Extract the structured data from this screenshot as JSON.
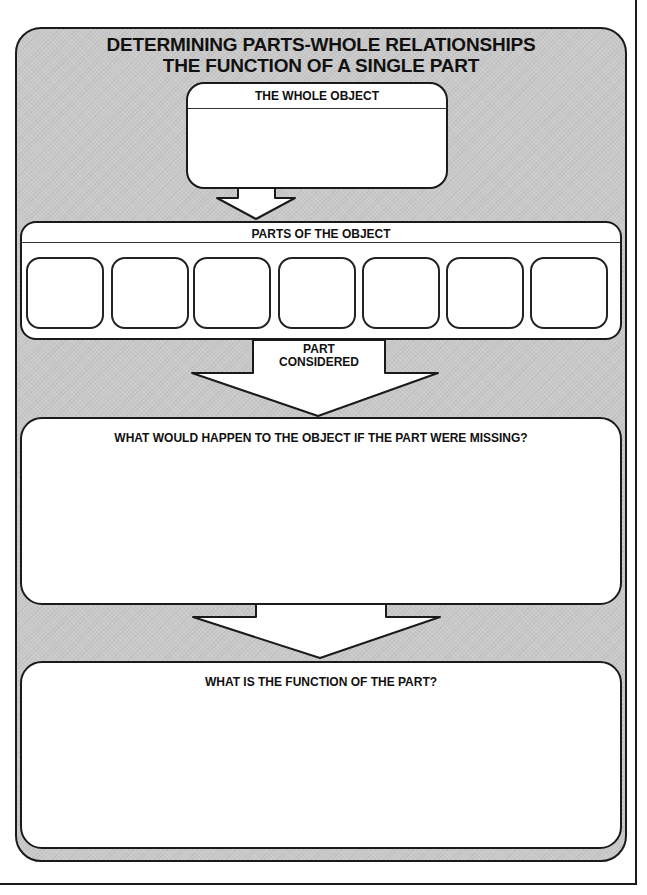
{
  "title": {
    "line1": "DETERMINING PARTS-WHOLE RELATIONSHIPS",
    "line2": "THE FUNCTION OF A SINGLE PART"
  },
  "whole_object": {
    "label": "THE WHOLE OBJECT",
    "value": ""
  },
  "parts": {
    "label": "PARTS OF THE OBJECT",
    "cells": [
      "",
      "",
      "",
      "",
      "",
      "",
      ""
    ]
  },
  "part_considered": {
    "line1": "PART",
    "line2": "CONSIDERED"
  },
  "missing": {
    "label": "WHAT WOULD HAPPEN TO THE OBJECT IF THE PART WERE MISSING?",
    "value": ""
  },
  "function": {
    "label": "WHAT IS THE FUNCTION OF THE PART?",
    "value": ""
  },
  "colors": {
    "panel": "#c9c9c9",
    "box": "#ffffff",
    "stroke": "#1a1a1a"
  }
}
